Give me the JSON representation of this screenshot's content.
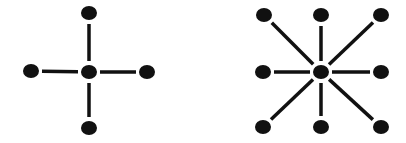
{
  "diagram": {
    "background": "#ffffff",
    "ink_color": "#111111",
    "node_radius": 7.5,
    "edge_width": 3.5,
    "edge_gap": 11,
    "graphs": [
      {
        "name": "four-neighbor-star",
        "label": "4-connectivity",
        "center": {
          "x": 89,
          "y": 72
        },
        "neighbors": [
          {
            "x": 89,
            "y": 13
          },
          {
            "x": 31,
            "y": 71
          },
          {
            "x": 147,
            "y": 72
          },
          {
            "x": 89,
            "y": 128
          }
        ]
      },
      {
        "name": "eight-neighbor-star",
        "label": "8-connectivity",
        "center": {
          "x": 321,
          "y": 72
        },
        "neighbors": [
          {
            "x": 264,
            "y": 15
          },
          {
            "x": 321,
            "y": 15
          },
          {
            "x": 381,
            "y": 15
          },
          {
            "x": 263,
            "y": 72
          },
          {
            "x": 381,
            "y": 72
          },
          {
            "x": 263,
            "y": 127
          },
          {
            "x": 321,
            "y": 127
          },
          {
            "x": 381,
            "y": 127
          }
        ]
      }
    ]
  }
}
